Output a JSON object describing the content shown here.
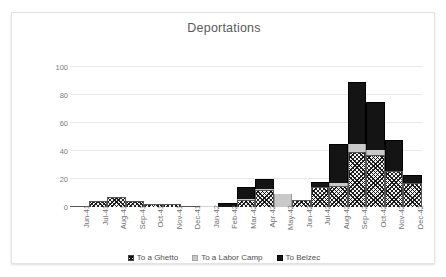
{
  "chart_data": {
    "type": "bar",
    "stacked": true,
    "title": "Deportations",
    "xlabel": "",
    "ylabel": "Number of Deportations",
    "ylim": [
      0,
      100
    ],
    "yticks": [
      0,
      20,
      40,
      60,
      80,
      100
    ],
    "grid": true,
    "legend_position": "bottom",
    "categories": [
      "Jun-41",
      "Jul-41",
      "Aug-41",
      "Sep-41",
      "Oct-41",
      "Nov-41",
      "Dec-41",
      "Jan-42",
      "Feb-42",
      "Mar-42",
      "Apr-42",
      "May-42",
      "Jun-42",
      "Jul-42",
      "Aug-42",
      "Sep-42",
      "Oct-42",
      "Nov-42",
      "Dec-42"
    ],
    "series": [
      {
        "name": "To a Ghetto",
        "pattern": "crosshatch",
        "color": "#f2f2f2",
        "values": [
          1,
          4,
          7,
          4,
          2,
          2,
          1,
          0,
          0,
          5,
          12,
          0,
          5,
          14,
          15,
          39,
          37,
          26,
          17
        ]
      },
      {
        "name": "To a Labor Camp",
        "pattern": "solid",
        "color": "#c9c9c9",
        "values": [
          0,
          0,
          0,
          0,
          0,
          0,
          0,
          0,
          0,
          1,
          1,
          9,
          0,
          0,
          2,
          6,
          4,
          0,
          0
        ]
      },
      {
        "name": "To Belzec",
        "pattern": "solid",
        "color": "#141414",
        "values": [
          0,
          0,
          0,
          0,
          0,
          0,
          0,
          0,
          3,
          8,
          7,
          0,
          0,
          4,
          28,
          44,
          34,
          22,
          6
        ]
      }
    ],
    "totals": [
      1,
      4,
      7,
      4,
      2,
      2,
      1,
      0,
      3,
      14,
      20,
      9,
      5,
      18,
      45,
      89,
      75,
      48,
      23
    ]
  }
}
